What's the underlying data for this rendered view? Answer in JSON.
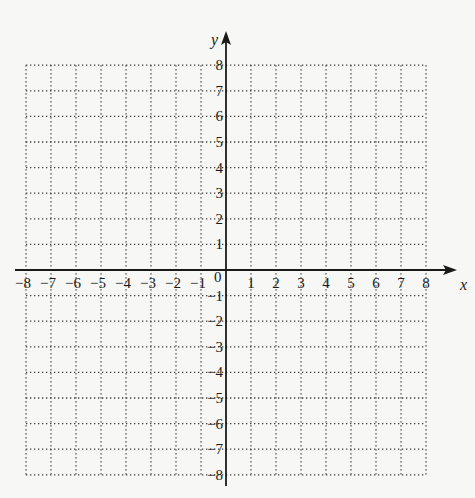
{
  "chart_data": {
    "type": "scatter",
    "title": "",
    "xlabel": "x",
    "ylabel": "y",
    "xlim": [
      -8,
      8
    ],
    "ylim": [
      -8,
      8
    ],
    "grid": "dotted",
    "x_ticks": [
      -8,
      -7,
      -6,
      -5,
      -4,
      -3,
      -2,
      -1,
      1,
      2,
      3,
      4,
      5,
      6,
      7,
      8
    ],
    "x_tick_labels": [
      "−8",
      "−7",
      "−6",
      "−5",
      "−4",
      "−3",
      "−2",
      "−1",
      "1",
      "2",
      "3",
      "4",
      "5",
      "6",
      "7",
      "8"
    ],
    "y_ticks": [
      8,
      7,
      6,
      5,
      4,
      3,
      2,
      1,
      -1,
      -2,
      -3,
      -4,
      -5,
      -6,
      -7,
      -8
    ],
    "y_tick_labels": [
      "8",
      "7",
      "6",
      "5",
      "4",
      "3",
      "2",
      "1",
      "−1",
      "−2",
      "−3",
      "−4",
      "−5",
      "−6",
      "−7",
      "−8"
    ],
    "origin_label": "0",
    "series": [],
    "legend": null
  },
  "colors": {
    "axis": "#1a1a1a",
    "grid": "#3a3a3a",
    "background": "#f7f7f5"
  }
}
